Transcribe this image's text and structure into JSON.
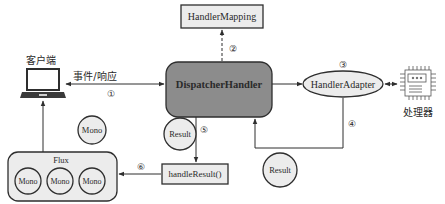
{
  "diagram": {
    "nodes": {
      "client": {
        "label": "客户端",
        "icon": "laptop-icon"
      },
      "handler_mapping": {
        "label": "HandlerMapping"
      },
      "dispatcher_handler": {
        "label": "DispatcherHandler"
      },
      "handler_adapter": {
        "label": "HandlerAdapter"
      },
      "processor": {
        "label": "处理器",
        "icon": "chip-icon"
      },
      "handle_result": {
        "label": "handleResult()"
      },
      "flux": {
        "label": "Flux",
        "items": [
          "Mono",
          "Mono",
          "Mono"
        ]
      },
      "mono_single": {
        "label": "Mono"
      },
      "result_left": {
        "label": "Result"
      },
      "result_right": {
        "label": "Result"
      }
    },
    "edges": {
      "client_dispatcher": {
        "label": "事件/响应",
        "step": "①"
      },
      "dispatcher_mapping": {
        "step": "②"
      },
      "dispatcher_adapter": {
        "step": "③"
      },
      "adapter_dispatcher": {
        "step": "④"
      },
      "dispatcher_handleresult": {
        "step": "⑤"
      },
      "handleresult_flux": {
        "step": "⑥"
      }
    },
    "colors": {
      "dispatcher_fill": "#8c8c8c",
      "box_fill": "#ececec",
      "circle_fill": "#ececec",
      "stroke": "#2e2e2e"
    }
  }
}
